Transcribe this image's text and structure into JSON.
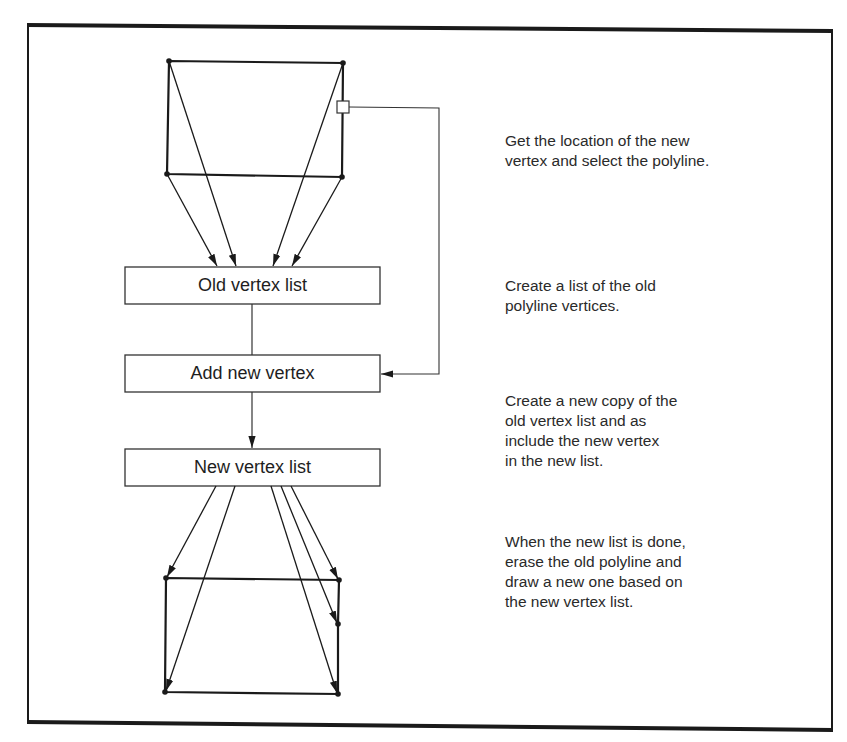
{
  "diagram": {
    "colors": {
      "background": "#ffffff",
      "stroke": "#222222",
      "text": "#222222"
    },
    "boxes": [
      {
        "id": "old-vertex-list",
        "label": "Old vertex list"
      },
      {
        "id": "add-new-vertex",
        "label": "Add new vertex"
      },
      {
        "id": "new-vertex-list",
        "label": "New vertex list"
      }
    ],
    "descriptions": [
      {
        "text": "Get the location of the new\nvertex and select the polyline."
      },
      {
        "text": "Create a list of the old\npolyline vertices."
      },
      {
        "text": "Create a new copy of the\nold vertex list and as\ninclude the new vertex\nin the new list."
      },
      {
        "text": "When the new list is done,\nerase the old polyline and\ndraw a new one based on\nthe new vertex list."
      }
    ],
    "old_polyline": {
      "vertices": [
        [
          169,
          61
        ],
        [
          343,
          63
        ],
        [
          342,
          177
        ],
        [
          167,
          174
        ]
      ],
      "selection_marker": [
        343,
        107
      ]
    },
    "new_polyline": {
      "vertices": [
        [
          166,
          578
        ],
        [
          339,
          580
        ],
        [
          338,
          624
        ],
        [
          338,
          694
        ],
        [
          165,
          692
        ]
      ]
    }
  }
}
